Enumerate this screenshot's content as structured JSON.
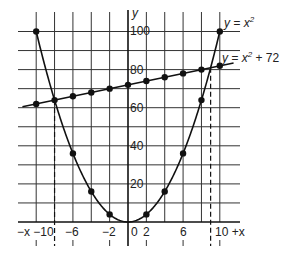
{
  "chart_data": {
    "type": "line",
    "title": "",
    "xlabel": "x",
    "ylabel": "y",
    "xlim": [
      -11,
      12
    ],
    "ylim": [
      0,
      105
    ],
    "grid": true,
    "x_ticks": [
      -10,
      -8,
      -6,
      -4,
      -2,
      0,
      2,
      4,
      6,
      8,
      10
    ],
    "x_tick_labels": [
      "−x −10",
      "−6",
      "−2",
      "0",
      "2",
      "6",
      "10 +x"
    ],
    "x_tick_label_values": [
      -10,
      -6,
      -2,
      0,
      2,
      6,
      10
    ],
    "y_tick_labels": [
      "100",
      "80",
      "60",
      "40",
      "20"
    ],
    "y_tick_label_values": [
      100,
      80,
      60,
      40,
      20
    ],
    "series": [
      {
        "name": "y = x²",
        "kind": "curve",
        "x": [
          -10,
          -6,
          -4,
          -2,
          2,
          4,
          6,
          8,
          10
        ],
        "values": [
          100,
          36,
          16,
          4,
          4,
          16,
          36,
          64,
          100
        ]
      },
      {
        "name": "y = x + 72",
        "kind": "line",
        "x": [
          -10,
          -8,
          -6,
          -4,
          -2,
          0,
          2,
          4,
          6,
          8,
          10
        ],
        "values": [
          62,
          64,
          66,
          68,
          70,
          72,
          74,
          76,
          78,
          80,
          82
        ]
      }
    ],
    "annotations": [
      {
        "text": "y = x²",
        "position": "upper right"
      },
      {
        "text": "y = x² + 72",
        "position": "right, near line"
      },
      {
        "type": "dashed-vertical",
        "x": -8,
        "note": "intersection"
      },
      {
        "type": "dashed-vertical",
        "x": 9,
        "note": "intersection"
      }
    ]
  },
  "labels": {
    "y_axis": "y",
    "curve_label_prefix": "y = x",
    "curve_label_sup": "2",
    "line_label_prefix": "y = x",
    "line_label_sup": "2",
    "line_label_suffix": " + 72",
    "x_neg": "−x −10",
    "x_m6": "−6",
    "x_m2": "−2",
    "x_0": "0",
    "x_2": "2",
    "x_6": "6",
    "x_pos": "10 +x",
    "y_100": "100",
    "y_80": "80",
    "y_60": "60",
    "y_40": "40",
    "y_20": "20"
  }
}
